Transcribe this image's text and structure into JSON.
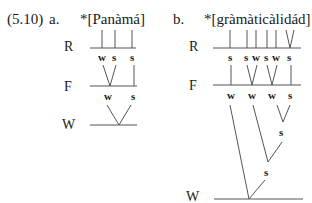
{
  "example_number": "(5.10)",
  "panels": {
    "a": {
      "label": "a.",
      "word": "*[Panàmá]",
      "tiers": {
        "R": "R",
        "F": "F",
        "W": "W"
      },
      "R_nodes": [
        "w",
        "s",
        "s"
      ],
      "F_nodes": [
        "w",
        "s"
      ]
    },
    "b": {
      "label": "b.",
      "word": "*[gràmàticàlidád]",
      "tiers": {
        "R": "R",
        "F": "F",
        "W": "W"
      },
      "R_nodes": [
        "s",
        "s",
        "w",
        "s",
        "w",
        "s"
      ],
      "F_nodes": [
        "w",
        "w",
        "w",
        "s"
      ],
      "W_nodes": [
        "s",
        "s"
      ]
    }
  }
}
